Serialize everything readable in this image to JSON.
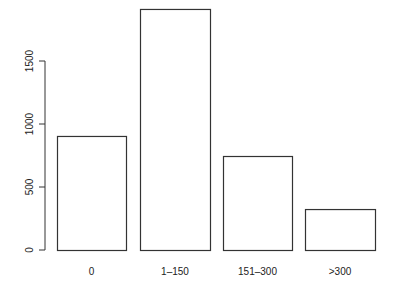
{
  "chart_data": {
    "type": "bar",
    "title": "",
    "xlabel": "",
    "ylabel": "",
    "categories": [
      "0",
      "1–150",
      "151–300",
      ">300"
    ],
    "values": [
      905,
      1913,
      746,
      325
    ],
    "ylim": [
      0,
      1913
    ],
    "yticks": [
      0,
      500,
      1000,
      1500
    ],
    "grid": false,
    "legend": null,
    "bar_fill": "#ffffff",
    "bar_stroke": "#333333"
  },
  "layout": {
    "y_zero_px": 250,
    "px_per_unit": 0.126,
    "bars_px": [
      {
        "x": 57,
        "w": 69
      },
      {
        "x": 140,
        "w": 70
      },
      {
        "x": 223,
        "w": 69
      },
      {
        "x": 305,
        "w": 70
      }
    ],
    "yaxis_x": 45,
    "xlabel_y": 275
  }
}
